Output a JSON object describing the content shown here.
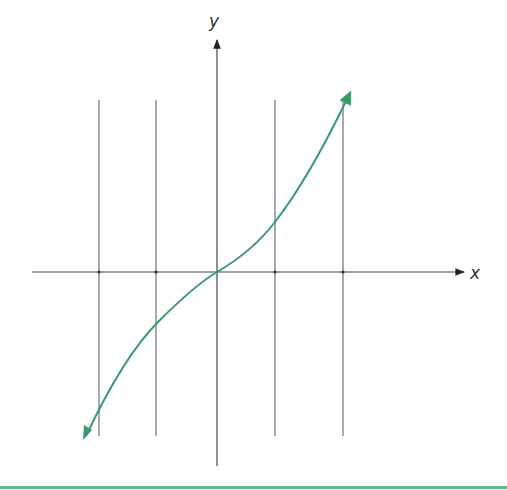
{
  "axes": {
    "x_label": "x",
    "y_label": "y",
    "origin": [
      217,
      272
    ],
    "x_axis": {
      "x_start": 32,
      "x_end": 466,
      "y": 272
    },
    "y_axis": {
      "x": 217,
      "y_start": 466,
      "y_end": 38
    }
  },
  "vertical_lines": [
    {
      "x": 99,
      "y1": 100,
      "y2": 436
    },
    {
      "x": 156,
      "y1": 100,
      "y2": 436
    },
    {
      "x": 275,
      "y1": 100,
      "y2": 436
    },
    {
      "x": 343,
      "y1": 100,
      "y2": 436
    }
  ],
  "curve": {
    "color": "#3a9a6a",
    "description": "odd increasing function through origin with arrowheads at both ends",
    "points": [
      [
        86,
        436
      ],
      [
        156,
        322
      ],
      [
        217,
        272
      ],
      [
        275,
        220
      ],
      [
        349,
        92
      ]
    ]
  },
  "footer_rule": {
    "color": "#5fb88a",
    "y": 487
  }
}
